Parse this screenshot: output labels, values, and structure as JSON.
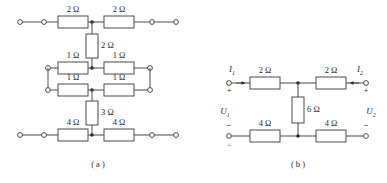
{
  "figure": {
    "caption_a": "( a )",
    "caption_b": "( b )"
  },
  "circuit_a": {
    "name": "resistive-ladder-network",
    "resistors": [
      {
        "id": "a-r1",
        "label": "2 Ω",
        "orientation": "horizontal",
        "row": "top",
        "side": "left"
      },
      {
        "id": "a-r2",
        "label": "2 Ω",
        "orientation": "horizontal",
        "row": "top",
        "side": "right"
      },
      {
        "id": "a-r3",
        "label": "2 Ω",
        "orientation": "vertical",
        "row": "upper-middle",
        "side": "center"
      },
      {
        "id": "a-r4",
        "label": "1 Ω",
        "orientation": "horizontal",
        "row": "middle-upper",
        "side": "left"
      },
      {
        "id": "a-r5",
        "label": "1 Ω",
        "orientation": "horizontal",
        "row": "middle-upper",
        "side": "right"
      },
      {
        "id": "a-r6",
        "label": "1 Ω",
        "orientation": "horizontal",
        "row": "middle-lower",
        "side": "left"
      },
      {
        "id": "a-r7",
        "label": "1 Ω",
        "orientation": "horizontal",
        "row": "middle-lower",
        "side": "right"
      },
      {
        "id": "a-r8",
        "label": "3 Ω",
        "orientation": "vertical",
        "row": "lower-middle",
        "side": "center"
      },
      {
        "id": "a-r9",
        "label": "4 Ω",
        "orientation": "horizontal",
        "row": "bottom",
        "side": "left"
      },
      {
        "id": "a-r10",
        "label": "4 Ω",
        "orientation": "horizontal",
        "row": "bottom",
        "side": "right"
      }
    ],
    "terminals": [
      {
        "id": "a-t1",
        "row": "top",
        "side": "left-outer"
      },
      {
        "id": "a-t2",
        "row": "top",
        "side": "left-inner"
      },
      {
        "id": "a-t3",
        "row": "top",
        "side": "right-inner"
      },
      {
        "id": "a-t4",
        "row": "top",
        "side": "right-outer"
      },
      {
        "id": "a-t5",
        "row": "middle-upper",
        "side": "left"
      },
      {
        "id": "a-t6",
        "row": "middle-upper",
        "side": "right"
      },
      {
        "id": "a-t7",
        "row": "middle-lower",
        "side": "left"
      },
      {
        "id": "a-t8",
        "row": "middle-lower",
        "side": "right"
      },
      {
        "id": "a-t9",
        "row": "bottom",
        "side": "left-outer"
      },
      {
        "id": "a-t10",
        "row": "bottom",
        "side": "left-inner"
      },
      {
        "id": "a-t11",
        "row": "bottom",
        "side": "right-inner"
      },
      {
        "id": "a-t12",
        "row": "bottom",
        "side": "right-outer"
      }
    ]
  },
  "circuit_b": {
    "name": "two-port-bridged-t-network",
    "resistors": [
      {
        "id": "b-r1",
        "label": "2 Ω",
        "orientation": "horizontal",
        "row": "top",
        "side": "left"
      },
      {
        "id": "b-r2",
        "label": "2 Ω",
        "orientation": "horizontal",
        "row": "top",
        "side": "right"
      },
      {
        "id": "b-r3",
        "label": "6 Ω",
        "orientation": "vertical",
        "row": "middle",
        "side": "center"
      },
      {
        "id": "b-r4",
        "label": "4 Ω",
        "orientation": "horizontal",
        "row": "bottom",
        "side": "left"
      },
      {
        "id": "b-r5",
        "label": "4 Ω",
        "orientation": "horizontal",
        "row": "bottom",
        "side": "right"
      }
    ],
    "currents": [
      {
        "id": "b-i1",
        "label": "I",
        "subscript": "1",
        "direction": "into-port-1"
      },
      {
        "id": "b-i2",
        "label": "I",
        "subscript": "2",
        "direction": "into-port-2"
      }
    ],
    "voltages": [
      {
        "id": "b-u1",
        "label": "U",
        "subscript": "1",
        "plus": "+",
        "minus": "−",
        "extra_sign": "+"
      },
      {
        "id": "b-u2",
        "label": "U",
        "subscript": "2",
        "plus": "+",
        "minus": "−"
      }
    ]
  },
  "colors": {
    "wire": "#4a4a4a",
    "node": "#2a2a2a",
    "text": "#2a2a2a",
    "background": "#ffffff"
  }
}
